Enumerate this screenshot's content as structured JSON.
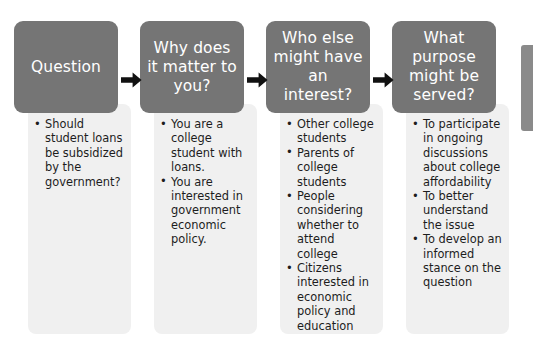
{
  "diagram": {
    "type": "process-flow",
    "title": "",
    "colors": {
      "header_background": "#757575",
      "header_text": "#ffffff",
      "body_background": "#f0f0f0",
      "body_text": "#1d1d1d",
      "arrow": "#111111",
      "page_background": "#ffffff"
    },
    "arrow_glyph": "right-arrow",
    "columns": [
      {
        "header": "Question",
        "items": [
          "Should student loans be subsidized by the government?"
        ]
      },
      {
        "header": "Why does it matter to you?",
        "items": [
          "You are a college student with loans.",
          "You are interested in government economic policy."
        ]
      },
      {
        "header": "Who else might have an interest?",
        "items": [
          "Other college students",
          "Parents of college students",
          "People considering whether to attend college",
          "Citizens interested in economic policy and education"
        ]
      },
      {
        "header": "What purpose might be served?",
        "items": [
          "To participate in ongoing discussions about college affordability",
          "To better understand the issue",
          "To develop an informed stance on the question"
        ]
      }
    ]
  }
}
